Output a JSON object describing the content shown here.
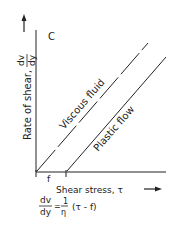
{
  "panel_label": "C",
  "y_axis": {
    "label": "Rate of shear,",
    "symbol_num": "dv",
    "symbol_den": "dy"
  },
  "x_axis": {
    "label": "Shear stress, τ"
  },
  "tick_f": "f",
  "lines": [
    {
      "name": "Viscous fluid",
      "style": "dashed"
    },
    {
      "name": "Plastic flow",
      "style": "solid"
    }
  ],
  "equation": {
    "lhs_num": "dv",
    "lhs_den": "dy",
    "eq": "=",
    "coef_num": "1",
    "coef_den": "η",
    "rhs": "(τ - f)"
  },
  "colors": {
    "ink": "#222222",
    "background": "#ffffff"
  }
}
